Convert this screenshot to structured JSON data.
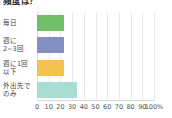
{
  "chart_data": {
    "type": "bar",
    "orientation": "horizontal",
    "title": "頻度は？",
    "xlabel": "",
    "ylabel": "",
    "categories": [
      "毎日",
      "週に\n2~3回",
      "週に1回\n以下",
      "外出先で\nのみ"
    ],
    "category_lines": [
      [
        "毎日"
      ],
      [
        "週に",
        "2~3回"
      ],
      [
        "週に1回",
        "以下"
      ],
      [
        "外出先で",
        "のみ"
      ]
    ],
    "values": [
      23,
      23,
      23,
      34
    ],
    "xlim": [
      0,
      100
    ],
    "xticks": [
      0,
      10,
      20,
      30,
      40,
      50,
      60,
      70,
      80,
      90,
      100
    ],
    "xtick_labels": [
      "0",
      "10",
      "20",
      "30",
      "40",
      "50",
      "60",
      "70",
      "80",
      "90",
      "100%"
    ],
    "grid": true,
    "legend": "none",
    "colors": [
      "#72bf6a",
      "#8490c4",
      "#f5c14e",
      "#a8dcd4"
    ]
  }
}
